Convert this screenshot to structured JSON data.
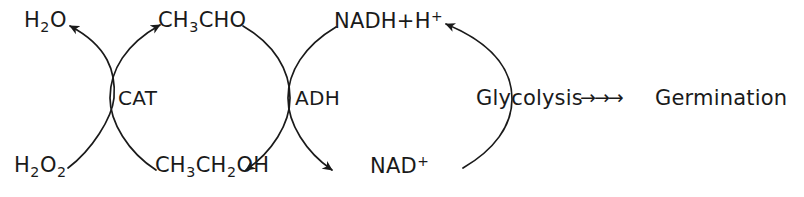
{
  "diagram": {
    "stroke_color": "#1a1a1a",
    "background_color": "#ffffff",
    "metabolites": {
      "water": {
        "formula": "H",
        "sub1": "2",
        "rest": "O"
      },
      "hydrogen_peroxide": {
        "formula": "H",
        "sub1": "2",
        "mid": "O",
        "sub2": "2"
      },
      "acetaldehyde": {
        "part1": "CH",
        "sub1": "3",
        "part2": "CHO"
      },
      "ethanol": {
        "part1": "CH",
        "sub1": "3",
        "part2": "CH",
        "sub2": "2",
        "part3": "OH"
      },
      "nadh": {
        "text": "NADH+H",
        "sup": "+"
      },
      "nad_plus": {
        "text": "NAD",
        "sup": "+"
      }
    },
    "enzymes": {
      "catalase": "CAT",
      "alcohol_dehydrogenase": "ADH"
    },
    "pathway": {
      "source": "Glycolysis",
      "arrows": "→→→",
      "target": "Germination"
    }
  }
}
